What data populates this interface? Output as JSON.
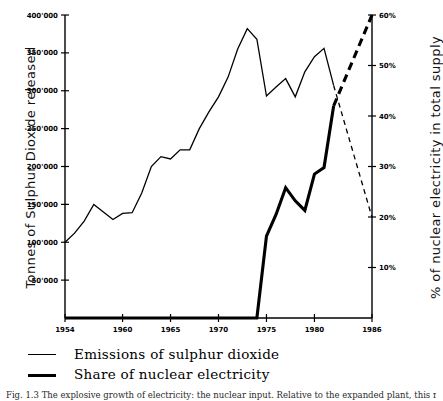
{
  "figure": {
    "caption": "Fig. 1.3   The explosive growth of electricity: the nuclear input. Relative to the expanded plant, this reduction is substantial."
  },
  "chart_data": {
    "type": "line",
    "title": "",
    "xlabel": "",
    "ylabel": "Tonnes of Sulphur Dioxide released",
    "y2label": "% of nuclear electricity in total supply",
    "grid": false,
    "legend_position": "below-plot",
    "xlim": [
      1954,
      1986
    ],
    "ylim": [
      0,
      400000
    ],
    "y2lim": [
      0,
      60
    ],
    "xticks": [
      1954,
      1960,
      1965,
      1970,
      1975,
      1980,
      1986
    ],
    "xtick_labels": [
      "1954",
      "1960",
      "1965",
      "1970",
      "1975",
      "1980",
      "1986"
    ],
    "yticks": [
      50000,
      100000,
      150000,
      200000,
      250000,
      300000,
      350000,
      400000
    ],
    "ytick_labels": [
      "50'000",
      "100'000",
      "150'000",
      "200'000",
      "250'000",
      "300'000",
      "350'000",
      "400'000"
    ],
    "y2ticks": [
      10,
      20,
      30,
      40,
      50,
      60
    ],
    "y2tick_labels": [
      "10%",
      "20%",
      "30%",
      "40%",
      "50%",
      "60%"
    ],
    "series": [
      {
        "name": "Emissions of sulphur dioxide",
        "axis": "left",
        "style": "thin-solid",
        "x": [
          1954,
          1955,
          1956,
          1957,
          1958,
          1959,
          1960,
          1961,
          1962,
          1963,
          1964,
          1965,
          1966,
          1967,
          1968,
          1969,
          1970,
          1971,
          1972,
          1973,
          1974,
          1975,
          1976,
          1977,
          1978,
          1979,
          1980,
          1981,
          1982
        ],
        "values": [
          100000,
          112000,
          128000,
          150000,
          140000,
          130000,
          138000,
          139000,
          165000,
          200000,
          213000,
          210000,
          222000,
          222000,
          250000,
          272000,
          292000,
          318000,
          355000,
          382000,
          368000,
          293000,
          305000,
          316000,
          292000,
          325000,
          345000,
          356000,
          307000
        ]
      },
      {
        "name": "Emissions of sulphur dioxide (projected)",
        "axis": "left",
        "style": "thin-dashed",
        "x": [
          1982,
          1986
        ],
        "values": [
          307000,
          133000
        ]
      },
      {
        "name": "Share of nuclear electricity",
        "axis": "right",
        "style": "thick-solid",
        "x": [
          1954,
          1974,
          1975,
          1976,
          1977,
          1978,
          1979,
          1980,
          1981,
          1982
        ],
        "values": [
          0,
          0,
          16.2,
          20.5,
          25.8,
          23.2,
          21.3,
          28.5,
          29.8,
          42.0
        ]
      },
      {
        "name": "Share of nuclear electricity (projected)",
        "axis": "right",
        "style": "thick-dashed",
        "x": [
          1982,
          1986
        ],
        "values": [
          42.0,
          60.0
        ]
      }
    ],
    "legend_entries": [
      {
        "label": "Emissions of sulphur dioxide",
        "style": "thin"
      },
      {
        "label": "Share of nuclear electricity",
        "style": "thick"
      }
    ]
  }
}
